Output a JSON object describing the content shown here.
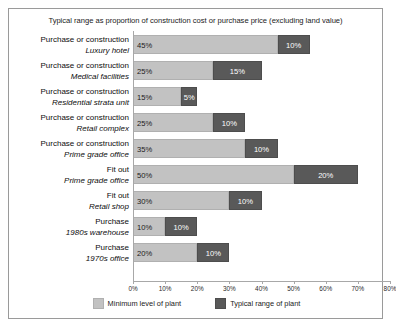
{
  "chart_data": {
    "type": "bar",
    "orientation": "horizontal",
    "stacked": true,
    "title": "Typical range as proportion of construction cost or purchase price (excluding land value)",
    "xlabel": "",
    "ylabel": "",
    "xlim": [
      0,
      80
    ],
    "xticks": [
      "0%",
      "10%",
      "20%",
      "30%",
      "40%",
      "50%",
      "60%",
      "70%",
      "80%"
    ],
    "xtick_values": [
      0,
      10,
      20,
      30,
      40,
      50,
      60,
      70,
      80
    ],
    "grid": false,
    "legend_position": "bottom",
    "colors": {
      "minimum": "#c2c2c2",
      "typical": "#595959",
      "frame": "#9a9a9a",
      "axis": "#a8a8a8"
    },
    "legend": [
      {
        "name": "Minimum level of plant",
        "color": "#c2c2c2"
      },
      {
        "name": "Typical range of plant",
        "color": "#595959"
      }
    ],
    "categories": [
      {
        "activity": "Purchase or construction",
        "asset": "Luxury hotel"
      },
      {
        "activity": "Purchase or construction",
        "asset": "Medical facilities"
      },
      {
        "activity": "Purchase or construction",
        "asset": "Residential strata unit"
      },
      {
        "activity": "Purchase or construction",
        "asset": "Retail complex"
      },
      {
        "activity": "Purchase or construction",
        "asset": "Prime grade office"
      },
      {
        "activity": "Fit out",
        "asset": "Prime grade office"
      },
      {
        "activity": "Fit out",
        "asset": "Retail shop"
      },
      {
        "activity": "Purchase",
        "asset": "1980s warehouse"
      },
      {
        "activity": "Purchase",
        "asset": "1970s office"
      }
    ],
    "series": [
      {
        "name": "Minimum level of plant",
        "values": [
          45,
          25,
          15,
          25,
          35,
          50,
          30,
          10,
          20
        ],
        "labels": [
          "45%",
          "25%",
          "15%",
          "25%",
          "35%",
          "50%",
          "30%",
          "10%",
          "20%"
        ]
      },
      {
        "name": "Typical range of plant",
        "values": [
          10,
          15,
          5,
          10,
          10,
          20,
          10,
          10,
          10
        ],
        "labels": [
          "10%",
          "15%",
          "5%",
          "10%",
          "10%",
          "20%",
          "10%",
          "10%",
          "10%"
        ]
      }
    ]
  }
}
